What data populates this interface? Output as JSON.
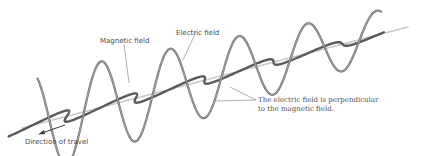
{
  "diagram": {
    "background": "#ffffff",
    "labels": {
      "magnetic_field": "Magnetic field",
      "electric_field": "Electric field",
      "perpendicular_line1": "The electric field is perpendicular",
      "perpendicular_line2": "to the magnetic field.",
      "direction": "Direction of travel"
    },
    "colors": {
      "axis": "#c8c8c8",
      "electric_wave": "#6e6e6e",
      "magnetic_wave": "#5a5a5a",
      "leader": "#7a7a7a",
      "arrow": "#3a3a3a"
    },
    "axis": {
      "x1": 22,
      "y1": 128,
      "x2": 408,
      "y2": 27
    },
    "electric_wave": {
      "start_t": 0.04,
      "end_t": 0.93,
      "cycles": 5.6,
      "amp_start": 52,
      "amp_end": 22,
      "phase": 0.1
    },
    "magnetic_wave": {
      "start_t": 0.0,
      "end_t": 0.93,
      "cycles": 5.6,
      "amp_start": 30,
      "amp_end": 13,
      "phase": 0.35
    }
  }
}
